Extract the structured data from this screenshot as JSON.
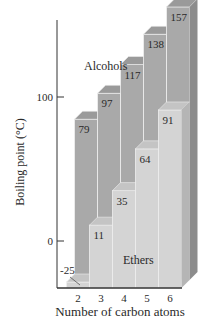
{
  "chart_data": {
    "type": "bar",
    "style": "3d-overlapping-columns",
    "title": "",
    "xlabel": "Number of carbon atoms",
    "ylabel": "Boiling point (°C)",
    "categories": [
      "2",
      "3",
      "4",
      "5",
      "6"
    ],
    "y_ticks": [
      {
        "value": 0,
        "label": "0"
      },
      {
        "value": 100,
        "label": "100"
      }
    ],
    "ylim": [
      -32,
      165
    ],
    "grid": false,
    "series": [
      {
        "name": "Alcohols",
        "position": "back",
        "color": "#a9a9a9",
        "top_color": "#9a9a9a",
        "side_color": "#8c8c8c",
        "values": [
          79,
          97,
          117,
          138,
          157
        ]
      },
      {
        "name": "Ethers",
        "position": "front",
        "color": "#d4d4d4",
        "top_color": "#c4c4c4",
        "side_color": "#b5b5b5",
        "values": [
          -25,
          11,
          35,
          64,
          91
        ]
      }
    ],
    "annotations": [
      {
        "text": "Alcohols",
        "series": "Alcohols"
      },
      {
        "text": "Ethers",
        "series": "Ethers"
      }
    ]
  }
}
